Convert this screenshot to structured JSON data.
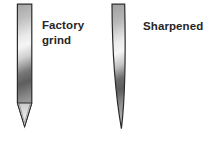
{
  "figure": {
    "labels": {
      "factory_grind": "Factory grind",
      "sharpened": "Sharpened"
    },
    "colors": {
      "background": "#ffffff",
      "outline": "#2b2b2b",
      "text": "#262626",
      "metal_bright": "#f5f5f5",
      "metal_mid": "#a6a6a6",
      "metal_dark": "#5d5d5d"
    }
  }
}
